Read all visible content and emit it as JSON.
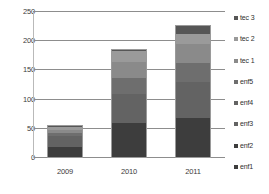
{
  "chart_data": {
    "type": "bar",
    "subtype": "stacked-bar",
    "title": "",
    "xlabel": "",
    "ylabel": "",
    "categories": [
      "2009",
      "2010",
      "2011"
    ],
    "ylim": [
      0,
      250
    ],
    "yticks": [
      0,
      50,
      100,
      150,
      200,
      250
    ],
    "ytick_labels": [
      "0",
      "50",
      "100",
      "150",
      "200",
      "250"
    ],
    "grid": true,
    "grid_axis": "y",
    "legend_position": "right",
    "legend_order_top_to_bottom": [
      "tec 3",
      "tec 2",
      "tec 1",
      "enf5",
      "enf4",
      "enf3",
      "enf2",
      "enf1"
    ],
    "stack_order_bottom_to_top": [
      "enf1",
      "enf2",
      "enf3",
      "enf4",
      "enf5",
      "tec 1",
      "tec 2",
      "tec 3"
    ],
    "series": [
      {
        "name": "enf1",
        "color": "#3d3d3d",
        "values": [
          10,
          30,
          34
        ]
      },
      {
        "name": "enf2",
        "color": "#3d3d3d",
        "values": [
          9,
          30,
          34
        ]
      },
      {
        "name": "enf3",
        "color": "#636363",
        "values": [
          9,
          25,
          31
        ]
      },
      {
        "name": "enf4",
        "color": "#636363",
        "values": [
          9,
          25,
          31
        ]
      },
      {
        "name": "enf5",
        "color": "#6e6e6e",
        "values": [
          6,
          27,
          33
        ]
      },
      {
        "name": "tec 1",
        "color": "#8a8a8a",
        "values": [
          5,
          27,
          32
        ]
      },
      {
        "name": "tec 2",
        "color": "#9a9a9a",
        "values": [
          5,
          19,
          17
        ]
      },
      {
        "name": "tec 3",
        "color": "#565656",
        "values": [
          4,
          4,
          16
        ]
      }
    ],
    "totals": [
      57,
      187,
      228
    ],
    "axis_color": "#8d8d8d",
    "text_color": "#3b3b3b",
    "background": "#ffffff"
  },
  "legend": {
    "items": [
      {
        "label": "tec 3",
        "color": "#565656"
      },
      {
        "label": "tec 2",
        "color": "#9a9a9a"
      },
      {
        "label": "tec 1",
        "color": "#8a8a8a"
      },
      {
        "label": "enf5",
        "color": "#6e6e6e"
      },
      {
        "label": "enf4",
        "color": "#636363"
      },
      {
        "label": "enf3",
        "color": "#636363"
      },
      {
        "label": "enf2",
        "color": "#3d3d3d"
      },
      {
        "label": "enf1",
        "color": "#3d3d3d"
      }
    ]
  }
}
